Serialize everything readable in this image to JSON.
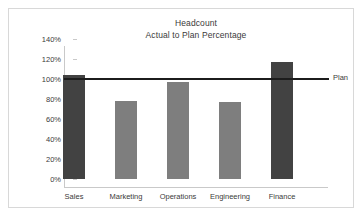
{
  "chart_data": {
    "type": "bar",
    "title": "Headcount",
    "subtitle": "Actual to Plan Percentage",
    "xlabel": "",
    "ylabel": "",
    "ylim": [
      0,
      140
    ],
    "ytick_values": [
      0,
      20,
      40,
      60,
      80,
      100,
      120,
      140
    ],
    "ytick_labels": [
      "0%",
      "20%",
      "40%",
      "60%",
      "80%",
      "100%",
      "120%",
      "140%"
    ],
    "grid": false,
    "legend": "none",
    "categories": [
      "Sales",
      "Marketing",
      "Operations",
      "Engineering",
      "Finance"
    ],
    "values": [
      104,
      78,
      97,
      77,
      117
    ],
    "bar_colors": [
      "#424242",
      "#7e7e7e",
      "#7e7e7e",
      "#7e7e7e",
      "#424242"
    ],
    "reference_line": {
      "label": "Plan",
      "value": 100,
      "color": "#1c1c1c"
    }
  },
  "colors": {
    "bar_dark": "#424242",
    "bar_light": "#7e7e7e",
    "axis": "#c9c9c9",
    "frame": "#d8d8d8",
    "text": "#3a3a3a",
    "plan_line": "#1c1c1c"
  }
}
